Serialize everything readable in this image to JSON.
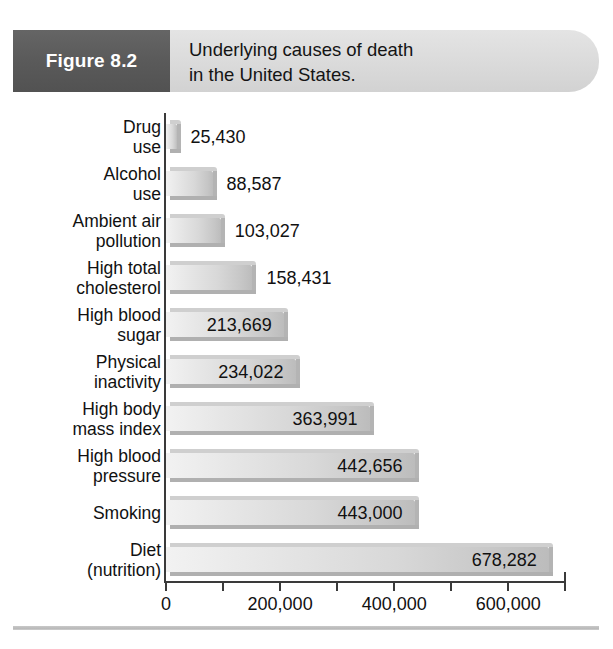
{
  "figure": {
    "number_label": "Figure 8.2",
    "caption_lines": [
      "Underlying causes of death",
      "in the United States."
    ]
  },
  "colors": {
    "header_band": "#dcdcdc",
    "figure_box": "#5a5a5a",
    "bar_light": "#f2f2f2",
    "bar_dark": "#bcbcbc",
    "axis": "#3a3a3a",
    "text": "#111111",
    "rule": "#b9b9b9"
  },
  "chart_data": {
    "type": "bar",
    "orientation": "horizontal",
    "title": "Underlying causes of death in the United States.",
    "xlabel": "",
    "ylabel": "",
    "xlim": [
      0,
      700000
    ],
    "grid": false,
    "legend": "none",
    "tick_labels": [
      "0",
      "200,000",
      "400,000",
      "600,000"
    ],
    "tick_values": [
      0,
      200000,
      400000,
      600000
    ],
    "minor_tick_values": [
      100000,
      300000,
      500000,
      700000
    ],
    "categories": [
      "Drug use",
      "Alcohol use",
      "Ambient air pollution",
      "High total cholesterol",
      "High blood sugar",
      "Physical inactivity",
      "High body mass index",
      "High blood pressure",
      "Smoking",
      "Diet (nutrition)"
    ],
    "values": [
      25430,
      88587,
      103027,
      158431,
      213669,
      234022,
      363991,
      442656,
      443000,
      678282
    ],
    "value_labels": [
      "25,430",
      "88,587",
      "103,027",
      "158,431",
      "213,669",
      "234,022",
      "363,991",
      "442,656",
      "443,000",
      "678,282"
    ]
  },
  "category_label_lines": [
    [
      "Drug",
      "use"
    ],
    [
      "Alcohol",
      "use"
    ],
    [
      "Ambient air",
      "pollution"
    ],
    [
      "High total",
      "cholesterol"
    ],
    [
      "High blood",
      "sugar"
    ],
    [
      "Physical",
      "inactivity"
    ],
    [
      "High body",
      "mass index"
    ],
    [
      "High blood",
      "pressure"
    ],
    [
      "Smoking"
    ],
    [
      "Diet",
      "(nutrition)"
    ]
  ]
}
